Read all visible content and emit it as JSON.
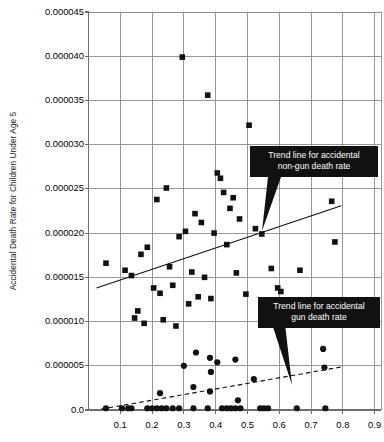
{
  "chart_data": {
    "type": "scatter",
    "title": "",
    "xlabel": "",
    "ylabel": "Accidental Death Rate for Children Under Age 5",
    "xlim": [
      0.0,
      0.92
    ],
    "ylim": [
      0.0,
      4.5e-05
    ],
    "grid": true,
    "legend_position": "none",
    "x_ticks": [
      "0.1",
      "0.2",
      "0.3",
      "0.4",
      "0.5",
      "0.6",
      "0.7",
      "0.8",
      "0.9"
    ],
    "x_tick_values": [
      0.1,
      0.2,
      0.3,
      0.4,
      0.5,
      0.6,
      0.7,
      0.8,
      0.9
    ],
    "y_ticks": [
      "0.0",
      "0.000005",
      "0.000010",
      "0.000015",
      "0.000020",
      "0.000025",
      "0.000030",
      "0.000035",
      "0.000040",
      "0.000045"
    ],
    "y_tick_values": [
      0.0,
      5e-06,
      1e-05,
      1.5e-05,
      2e-05,
      2.5e-05,
      3e-05,
      3.5e-05,
      4e-05,
      4.5e-05
    ],
    "series": [
      {
        "name": "Accidental non-gun death rate",
        "marker": "square",
        "color": "#111111",
        "points": [
          [
            0.055,
            1.66e-05
          ],
          [
            0.295,
            3.99e-05
          ],
          [
            0.375,
            3.56e-05
          ],
          [
            0.505,
            3.22e-05
          ],
          [
            0.245,
            2.51e-05
          ],
          [
            0.215,
            2.38e-05
          ],
          [
            0.405,
            2.68e-05
          ],
          [
            0.415,
            2.62e-05
          ],
          [
            0.425,
            2.46e-05
          ],
          [
            0.455,
            2.4e-05
          ],
          [
            0.445,
            2.28e-05
          ],
          [
            0.335,
            2.22e-05
          ],
          [
            0.355,
            2.12e-05
          ],
          [
            0.475,
            2.16e-05
          ],
          [
            0.525,
            2.05e-05
          ],
          [
            0.545,
            1.99e-05
          ],
          [
            0.305,
            2.02e-05
          ],
          [
            0.285,
            1.96e-05
          ],
          [
            0.395,
            2e-05
          ],
          [
            0.435,
            1.87e-05
          ],
          [
            0.185,
            1.84e-05
          ],
          [
            0.165,
            1.76e-05
          ],
          [
            0.135,
            1.52e-05
          ],
          [
            0.115,
            1.58e-05
          ],
          [
            0.255,
            1.62e-05
          ],
          [
            0.325,
            1.56e-05
          ],
          [
            0.365,
            1.5e-05
          ],
          [
            0.465,
            1.55e-05
          ],
          [
            0.575,
            1.6e-05
          ],
          [
            0.665,
            1.58e-05
          ],
          [
            0.205,
            1.38e-05
          ],
          [
            0.225,
            1.32e-05
          ],
          [
            0.265,
            1.41e-05
          ],
          [
            0.345,
            1.28e-05
          ],
          [
            0.315,
            1.2e-05
          ],
          [
            0.385,
            1.26e-05
          ],
          [
            0.495,
            1.31e-05
          ],
          [
            0.155,
            1.12e-05
          ],
          [
            0.145,
            1.04e-05
          ],
          [
            0.175,
            9.8e-06
          ],
          [
            0.235,
            1.02e-05
          ],
          [
            0.275,
            9.5e-06
          ],
          [
            0.765,
            2.36e-05
          ],
          [
            0.775,
            1.9e-05
          ],
          [
            0.785,
            1.18e-05
          ],
          [
            0.595,
            1.38e-05
          ],
          [
            0.605,
            1.34e-05
          ]
        ]
      },
      {
        "name": "Accidental gun death rate",
        "marker": "circle",
        "color": "#111111",
        "points": [
          [
            0.055,
            2e-07
          ],
          [
            0.105,
            2e-07
          ],
          [
            0.125,
            2e-07
          ],
          [
            0.135,
            2e-07
          ],
          [
            0.185,
            2e-07
          ],
          [
            0.2,
            2e-07
          ],
          [
            0.215,
            2e-07
          ],
          [
            0.23,
            2e-07
          ],
          [
            0.245,
            2e-07
          ],
          [
            0.265,
            2e-07
          ],
          [
            0.285,
            2e-07
          ],
          [
            0.33,
            2e-07
          ],
          [
            0.375,
            2e-07
          ],
          [
            0.42,
            2e-07
          ],
          [
            0.435,
            2e-07
          ],
          [
            0.448,
            2e-07
          ],
          [
            0.462,
            2e-07
          ],
          [
            0.478,
            2e-07
          ],
          [
            0.54,
            2e-07
          ],
          [
            0.552,
            2e-07
          ],
          [
            0.565,
            2e-07
          ],
          [
            0.655,
            2e-07
          ],
          [
            0.745,
            2e-07
          ],
          [
            0.225,
            1.9e-06
          ],
          [
            0.33,
            2.6e-06
          ],
          [
            0.382,
            2.1e-06
          ],
          [
            0.47,
            1.1e-06
          ],
          [
            0.52,
            3.5e-06
          ],
          [
            0.385,
            4.3e-06
          ],
          [
            0.3,
            5e-06
          ],
          [
            0.405,
            5.4e-06
          ],
          [
            0.338,
            6.5e-06
          ],
          [
            0.382,
            5.9e-06
          ],
          [
            0.462,
            5.7e-06
          ],
          [
            0.742,
            4.8e-06
          ],
          [
            0.738,
            6.9e-06
          ]
        ]
      }
    ],
    "trend_lines": [
      {
        "name": "Trend line for accidental non-gun death rate",
        "style": "solid",
        "x_start": 0.025,
        "y_start": 1.38e-05,
        "x_end": 0.795,
        "y_end": 2.31e-05
      },
      {
        "name": "Trend line for accidental gun death rate",
        "style": "dashed",
        "x_start": 0.04,
        "y_start": 1e-07,
        "x_end": 0.8,
        "y_end": 4.9e-06
      }
    ],
    "annotations": [
      {
        "id": "callout-non-gun",
        "line1": "Trend line for accidental",
        "line2": "non-gun death rate",
        "text": "Trend line for accidental non-gun death rate"
      },
      {
        "id": "callout-gun",
        "line1": "Trend line for accidental",
        "line2": "gun death rate",
        "text": "Trend line for accidental gun death rate"
      }
    ],
    "colors": {
      "marker": "#111111",
      "grid": "#8c8c8c",
      "axis": "#6e6e6e",
      "callout_bg": "#111111",
      "callout_text": "#ffffff"
    }
  }
}
